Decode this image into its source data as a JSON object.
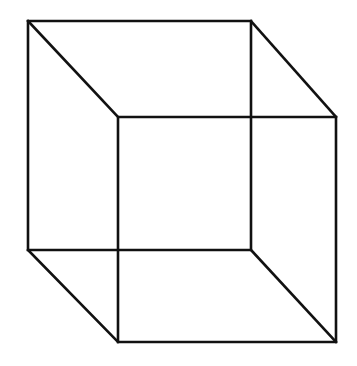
{
  "figure": {
    "name": "Necker cube",
    "kind": "wireframe-cube-line-drawing",
    "alt_text": "Necker cube: a two-dimensional line drawing of a transparent wireframe cube with no depth cues, an ambiguous reversible figure",
    "background_color": "#ffffff",
    "line_color": "#111111",
    "line_width": 2.6,
    "canvas": {
      "width": 357,
      "height": 366
    },
    "vertices": {
      "back_top_left": [
        28,
        21
      ],
      "back_top_right": [
        251,
        21
      ],
      "back_bottom_right": [
        251,
        250
      ],
      "back_bottom_left": [
        28,
        250
      ],
      "front_top_left": [
        118,
        117
      ],
      "front_top_right": [
        336,
        117
      ],
      "front_bottom_right": [
        336,
        342
      ],
      "front_bottom_left": [
        118,
        342
      ]
    },
    "edges": {
      "back_face": "28,21 251,21 251,250 28,250 28,21",
      "front_face": "118,117 336,117 336,342 118,342 118,117",
      "connector_top_left": "28,21 118,117",
      "connector_top_right": "251,21 336,117",
      "connector_bottom_right": "251,250 336,342",
      "connector_bottom_left": "28,250 118,342"
    }
  }
}
